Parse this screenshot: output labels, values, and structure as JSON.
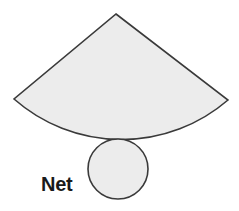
{
  "diagram": {
    "label": "Net",
    "colors": {
      "fill": "#ececec",
      "stroke": "#3a3a3a",
      "text": "#1a1a1a",
      "background": "#ffffff"
    },
    "shapes": [
      {
        "type": "sector",
        "apex": [
          116,
          14
        ],
        "left": [
          14,
          99
        ],
        "right": [
          228,
          100
        ],
        "arc_radius": 163
      },
      {
        "type": "circle",
        "center": [
          118,
          169
        ],
        "radius": 30
      }
    ]
  }
}
